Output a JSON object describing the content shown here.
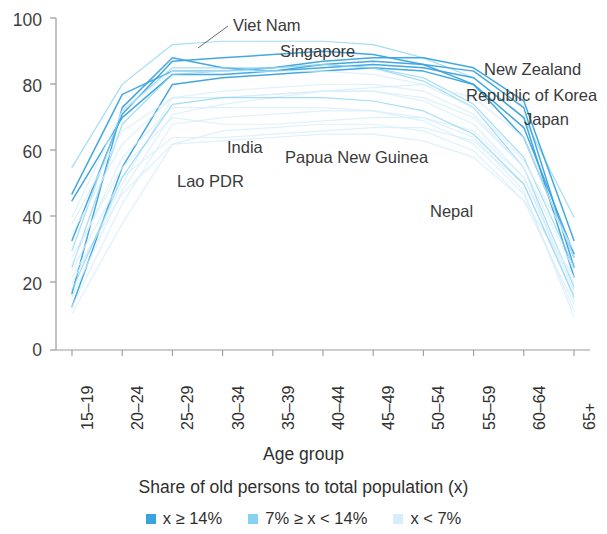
{
  "chart_data": {
    "type": "line",
    "title": "",
    "xlabel": "Age group",
    "ylabel": "",
    "ylim": [
      0,
      100
    ],
    "yticks": [
      0,
      20,
      40,
      60,
      80,
      100
    ],
    "grid": false,
    "legend_position": "bottom",
    "categories": [
      "15–19",
      "20–24",
      "25–29",
      "30–34",
      "35–39",
      "40–44",
      "45–49",
      "50–54",
      "55–59",
      "60–64",
      "65+"
    ],
    "series": [
      {
        "name": "Viet Nam",
        "group": "7% ≥ x < 14%",
        "values": [
          55,
          80,
          92,
          93,
          93,
          93,
          92,
          88,
          82,
          70,
          40
        ]
      },
      {
        "name": "Singapore",
        "group": "x ≥ 14%",
        "values": [
          33,
          71,
          87,
          88,
          89,
          90,
          89,
          86,
          80,
          64,
          28
        ]
      },
      {
        "name": "Japan",
        "group": "x ≥ 14%",
        "values": [
          17,
          73,
          88,
          85,
          84,
          86,
          87,
          86,
          84,
          73,
          25
        ]
      },
      {
        "name": "Republic of Korea",
        "group": "x ≥ 14%",
        "values": [
          13,
          55,
          80,
          82,
          83,
          84,
          85,
          84,
          80,
          67,
          29
        ]
      },
      {
        "name": "New Zealand",
        "group": "x ≥ 14%",
        "values": [
          47,
          77,
          84,
          84,
          85,
          87,
          88,
          88,
          85,
          75,
          33
        ]
      },
      {
        "name": "Australia",
        "group": "x ≥ 14%",
        "values": [
          45,
          70,
          83,
          83,
          84,
          85,
          86,
          85,
          82,
          70,
          22
        ]
      },
      {
        "name": "China",
        "group": "7% ≥ x < 14%",
        "values": [
          30,
          72,
          85,
          85,
          85,
          86,
          85,
          81,
          73,
          55,
          19
        ]
      },
      {
        "name": "Thailand",
        "group": "7% ≥ x < 14%",
        "values": [
          25,
          68,
          83,
          84,
          85,
          86,
          85,
          82,
          74,
          58,
          25
        ]
      },
      {
        "name": "Indonesia",
        "group": "x < 7%",
        "values": [
          35,
          62,
          76,
          76,
          77,
          78,
          79,
          80,
          76,
          64,
          28
        ]
      },
      {
        "name": "Malaysia",
        "group": "x < 7%",
        "values": [
          28,
          55,
          70,
          68,
          68,
          69,
          70,
          70,
          66,
          52,
          18
        ]
      },
      {
        "name": "Philippines",
        "group": "x < 7%",
        "values": [
          24,
          52,
          64,
          64,
          65,
          66,
          67,
          67,
          63,
          50,
          17
        ]
      },
      {
        "name": "India",
        "group": "x < 7%",
        "values": [
          22,
          47,
          62,
          63,
          64,
          65,
          65,
          63,
          58,
          45,
          22
        ]
      },
      {
        "name": "Lao PDR",
        "group": "x < 7%",
        "values": [
          40,
          72,
          84,
          84,
          84,
          84,
          83,
          80,
          73,
          57,
          30
        ]
      },
      {
        "name": "Papua New Guinea",
        "group": "x < 7%",
        "values": [
          38,
          66,
          76,
          76,
          77,
          78,
          78,
          76,
          70,
          55,
          24
        ]
      },
      {
        "name": "Nepal",
        "group": "x < 7%",
        "values": [
          26,
          58,
          73,
          73,
          73,
          73,
          72,
          69,
          62,
          47,
          12
        ]
      },
      {
        "name": "Cambodia",
        "group": "x < 7%",
        "values": [
          20,
          50,
          76,
          78,
          79,
          80,
          80,
          78,
          71,
          55,
          15
        ]
      },
      {
        "name": "Myanmar",
        "group": "x < 7%",
        "values": [
          13,
          44,
          68,
          70,
          71,
          72,
          72,
          70,
          64,
          48,
          10
        ]
      },
      {
        "name": "Bangladesh",
        "group": "x < 7%",
        "values": [
          11,
          38,
          62,
          66,
          67,
          68,
          68,
          66,
          60,
          45,
          14
        ]
      },
      {
        "name": "Mongolia",
        "group": "x < 7%",
        "values": [
          16,
          48,
          71,
          74,
          76,
          78,
          78,
          75,
          68,
          52,
          20
        ]
      },
      {
        "name": "Sri Lanka",
        "group": "7% ≥ x < 14%",
        "values": [
          18,
          52,
          74,
          76,
          76,
          76,
          75,
          72,
          65,
          50,
          16
        ]
      }
    ],
    "annotations": [
      {
        "text": "Viet Nam",
        "x_px": 233,
        "y_px": 16,
        "leader": true
      },
      {
        "text": "Singapore",
        "x_px": 280,
        "y_px": 42,
        "leader": false
      },
      {
        "text": "New Zealand",
        "x_px": 484,
        "y_px": 60,
        "leader": false
      },
      {
        "text": "Republic of Korea",
        "x_px": 466,
        "y_px": 86,
        "leader": false
      },
      {
        "text": "Japan",
        "x_px": 524,
        "y_px": 110,
        "leader": false
      },
      {
        "text": "India",
        "x_px": 227,
        "y_px": 138,
        "leader": false
      },
      {
        "text": "Papua New Guinea",
        "x_px": 285,
        "y_px": 148,
        "leader": false
      },
      {
        "text": "Lao PDR",
        "x_px": 177,
        "y_px": 172,
        "leader": false
      },
      {
        "text": "Nepal",
        "x_px": 430,
        "y_px": 202,
        "leader": false
      }
    ]
  },
  "axis": {
    "y_ticks": [
      "100",
      "80",
      "60",
      "40",
      "20",
      "0"
    ],
    "x_ticks": [
      "15–19",
      "20–24",
      "25–29",
      "30–34",
      "35–39",
      "40–44",
      "45–49",
      "50–54",
      "55–59",
      "60–64",
      "65+"
    ],
    "x_title": "Age group"
  },
  "legend": {
    "title": "Share of old persons to total population (x)",
    "items": [
      {
        "label": "x ≥ 14%",
        "color": "#3aa3dd"
      },
      {
        "label": "7% ≥ x < 14%",
        "color": "#86d2f2"
      },
      {
        "label": "x < 7%",
        "color": "#d6eefb"
      }
    ]
  },
  "colors": {
    "dark_blue": "#3aa3dd",
    "mid_blue": "#86d2f2",
    "light_blue": "#d6eefb",
    "axis": "#9a9a9a",
    "text": "#3a3a3a"
  }
}
